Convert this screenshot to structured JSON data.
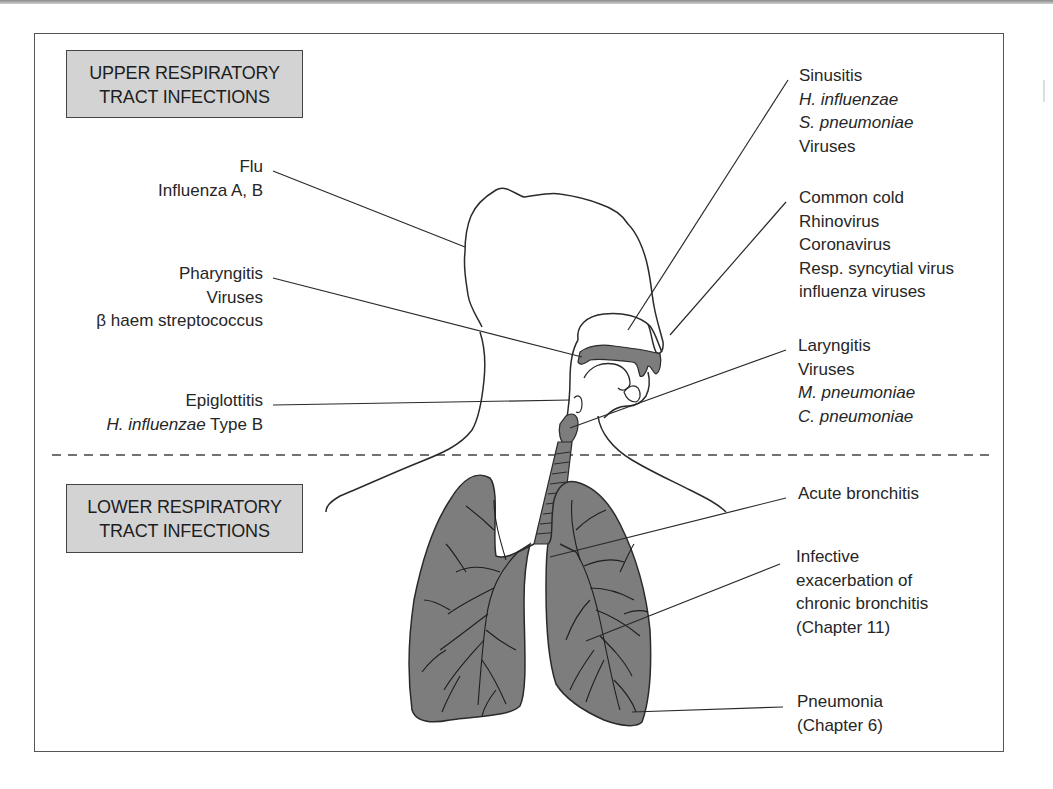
{
  "figure": {
    "sections": {
      "upper": {
        "line1": "UPPER RESPIRATORY",
        "line2": "TRACT INFECTIONS"
      },
      "lower": {
        "line1": "LOWER RESPIRATORY",
        "line2": "TRACT INFECTIONS"
      }
    },
    "colors": {
      "section_box_fill": "#d3d3d3",
      "anatomy_fill": "#7d7d7d",
      "line": "#2a2a2a",
      "frame": "#555555"
    },
    "left_labels": {
      "flu": {
        "title": "Flu",
        "lines": [
          "Influenza A, B"
        ]
      },
      "pharyngitis": {
        "title": "Pharyngitis",
        "lines": [
          "Viruses",
          "β haem streptococcus"
        ]
      },
      "epiglottitis": {
        "title": "Epiglottitis",
        "organism_italic": "H. influenzae",
        "organism_suffix": " Type B"
      }
    },
    "right_labels": {
      "sinusitis": {
        "title": "Sinusitis",
        "lines_italic": [
          "H. influenzae",
          "S. pneumoniae"
        ],
        "lines": [
          "Viruses"
        ]
      },
      "common_cold": {
        "title": "Common cold",
        "lines": [
          "Rhinovirus",
          "Coronavirus",
          "Resp. syncytial virus",
          "influenza viruses"
        ]
      },
      "laryngitis": {
        "title": "Laryngitis",
        "lines": [
          "Viruses"
        ],
        "lines_italic": [
          "M. pneumoniae",
          "C. pneumoniae"
        ]
      },
      "acute_bronchitis": {
        "title": "Acute bronchitis"
      },
      "infective_exacerbation": {
        "lines": [
          "Infective",
          "exacerbation of",
          "chronic bronchitis",
          "(Chapter 11)"
        ]
      },
      "pneumonia": {
        "title": "Pneumonia",
        "lines": [
          "(Chapter 6)"
        ]
      }
    }
  }
}
